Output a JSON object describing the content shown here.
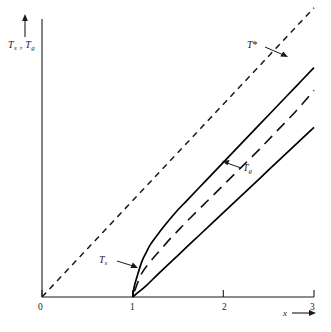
{
  "chart_data": {
    "type": "line",
    "title": "",
    "xlabel": "x",
    "ylabel": "Ts , Tg",
    "xlim": [
      0,
      3
    ],
    "ylim": [
      0,
      3
    ],
    "grid": false,
    "legend": "none",
    "xticks": [
      "0",
      "1",
      "2",
      "3"
    ],
    "xtick_values": [
      0,
      1,
      2,
      3
    ],
    "yticks": [],
    "axis_arrows": {
      "x": "right",
      "y": "up"
    },
    "annotations": [
      {
        "label": "T*",
        "target_x": 2.72,
        "target_y": 2.52,
        "arrow": "down-right"
      },
      {
        "label": "Tg",
        "target_x": 2.05,
        "target_y": 1.28,
        "arrow": "left"
      },
      {
        "label": "Ts",
        "target_x": 1.08,
        "target_y": 0.32,
        "arrow": "right"
      }
    ],
    "series": [
      {
        "name": "reference-line",
        "style": "short-dashed",
        "x": [
          0,
          3
        ],
        "y": [
          0,
          3.05
        ]
      },
      {
        "name": "Ts",
        "style": "solid",
        "x": [
          1.0,
          1.02,
          1.05,
          1.1,
          1.15,
          1.2,
          1.3,
          1.4,
          1.5,
          1.6,
          1.8,
          2.0,
          2.2,
          2.4,
          2.6,
          2.8,
          3.0
        ],
        "y": [
          0.0,
          0.12,
          0.22,
          0.37,
          0.47,
          0.56,
          0.69,
          0.81,
          0.92,
          1.02,
          1.22,
          1.42,
          1.62,
          1.82,
          2.02,
          2.22,
          2.42
        ]
      },
      {
        "name": "T*",
        "style": "long-dashed",
        "x": [
          1.02,
          1.1,
          1.2,
          1.3,
          1.4,
          1.5,
          1.6,
          1.8,
          2.0,
          2.2,
          2.4,
          2.6,
          2.8,
          3.0
        ],
        "y": [
          0.06,
          0.25,
          0.38,
          0.49,
          0.6,
          0.7,
          0.8,
          0.99,
          1.18,
          1.37,
          1.56,
          1.76,
          1.96,
          2.18
        ]
      },
      {
        "name": "Tg",
        "style": "solid",
        "x": [
          1.0,
          1.05,
          1.15,
          1.3,
          1.5,
          1.7,
          1.9,
          2.1,
          2.3,
          2.5,
          2.7,
          2.9,
          3.0
        ],
        "y": [
          0.0,
          0.04,
          0.12,
          0.26,
          0.44,
          0.62,
          0.8,
          0.98,
          1.16,
          1.34,
          1.52,
          1.7,
          1.79
        ]
      }
    ]
  },
  "labels": {
    "y_axis": {
      "t": "T",
      "s": "s",
      "comma": " , ",
      "t2": "T",
      "g": "g"
    },
    "x_axis": "x",
    "t_star": "T",
    "t_star_mark": "*",
    "tg_main": "T",
    "tg_sub": "g",
    "ts_main": "T",
    "ts_sub": "s",
    "tick_0": "0",
    "tick_1": "1",
    "tick_2": "2",
    "tick_3": "3"
  },
  "colors": {
    "background": "#ffffff",
    "axis": "#1a1a1a",
    "curve": "#000000",
    "text": "#1a1a1a"
  }
}
